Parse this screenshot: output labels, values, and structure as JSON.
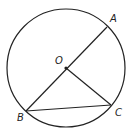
{
  "diagram": {
    "type": "circle-geometry",
    "circle": {
      "center": "O",
      "cx": 66,
      "cy": 68,
      "r": 59
    },
    "points": [
      {
        "name": "A",
        "label": "A",
        "x": 107,
        "y": 27,
        "lx": 110,
        "ly": 22
      },
      {
        "name": "O",
        "label": "O",
        "x": 66,
        "y": 68,
        "lx": 55,
        "ly": 64
      },
      {
        "name": "B",
        "label": "B",
        "x": 26,
        "y": 111,
        "lx": 17,
        "ly": 121
      },
      {
        "name": "C",
        "label": "C",
        "x": 111,
        "y": 105,
        "lx": 115,
        "ly": 116
      }
    ],
    "segments": [
      {
        "from": "A",
        "to": "B",
        "description": "diameter AB through O"
      },
      {
        "from": "O",
        "to": "C",
        "description": "radius OC"
      },
      {
        "from": "B",
        "to": "C",
        "description": "chord BC"
      }
    ],
    "colors": {
      "stroke": "#222222",
      "background": "#ffffff"
    }
  }
}
